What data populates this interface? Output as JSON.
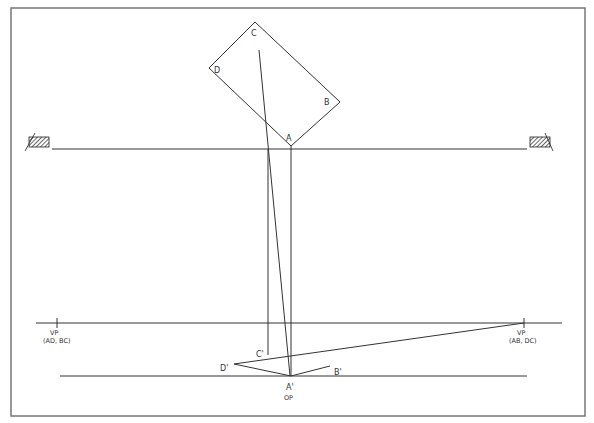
{
  "plan": {
    "corners": [
      "A",
      "B",
      "C",
      "D"
    ]
  },
  "projection": {
    "corners": [
      "A'",
      "B'",
      "C'",
      "D'"
    ],
    "observation_point": "OP"
  },
  "vanishing_points": {
    "left": {
      "label": "VP",
      "sub": "(AD, BC)"
    },
    "right": {
      "label": "VP",
      "sub": "(AB, DC)"
    }
  },
  "colors": {
    "line": "#333333",
    "frame": "#777777"
  }
}
